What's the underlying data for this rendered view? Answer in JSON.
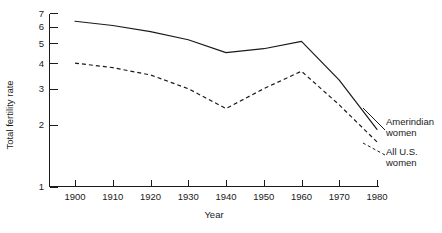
{
  "chart_data": {
    "type": "line",
    "title": "",
    "subtitle": "",
    "xlabel": "Year",
    "ylabel": "Total fertility rate",
    "x": [
      1900,
      1910,
      1920,
      1930,
      1940,
      1950,
      1960,
      1970,
      1980
    ],
    "xticklabels": [
      "1900",
      "1910",
      "1920",
      "1930",
      "1940",
      "1950",
      "1960",
      "1970",
      "1980"
    ],
    "xlim": [
      1900,
      1980
    ],
    "yticks": [
      1,
      2,
      3,
      4,
      5,
      6,
      7
    ],
    "yticklabels": [
      "1",
      "2",
      "3",
      "4",
      "5",
      "6",
      "7"
    ],
    "ylim": [
      1,
      7
    ],
    "yscale": "log",
    "grid": false,
    "legend_position": "right-inline-annotations",
    "series": [
      {
        "name": "Amerindian women",
        "style": "solid",
        "color": "#1a1a1a",
        "values": [
          6.4,
          6.1,
          5.7,
          5.2,
          4.5,
          4.7,
          5.1,
          3.3,
          1.9
        ]
      },
      {
        "name": "All U.S. women",
        "style": "dashed",
        "color": "#1a1a1a",
        "values": [
          4.0,
          3.8,
          3.5,
          3.0,
          2.4,
          3.0,
          3.65,
          2.5,
          1.65
        ]
      }
    ],
    "annotations": [
      {
        "text_line1": "Amerindian",
        "text_line2": "women",
        "target_series": "Amerindian women",
        "leader_style": "solid"
      },
      {
        "text_line1": "All U.S.",
        "text_line2": "women",
        "target_series": "All U.S. women",
        "leader_style": "dashed"
      }
    ]
  },
  "figure": {
    "background_color": "#ffffff",
    "ink_color": "#1a1a1a"
  }
}
